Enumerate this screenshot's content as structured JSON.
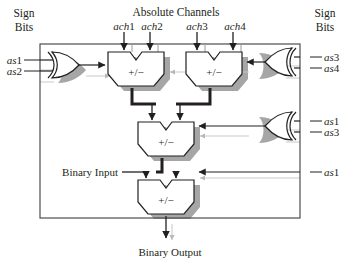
{
  "figure": {
    "title_top": "Absolute Channels",
    "sign_bits_left_line1": "Sign",
    "sign_bits_left_line2": "Bits",
    "sign_bits_right_line1": "Sign",
    "sign_bits_right_line2": "Bits",
    "binary_input": "Binary Input",
    "binary_output": "Binary Output"
  },
  "channels": [
    {
      "id": "ach1",
      "label_italic": "ach",
      "label_num": "1",
      "x": 124
    },
    {
      "id": "ach2",
      "label_italic": "ach",
      "label_num": "2",
      "x": 150
    },
    {
      "id": "ach3",
      "label_italic": "ach",
      "label_num": "3",
      "x": 197
    },
    {
      "id": "ach4",
      "label_italic": "ach",
      "label_num": "4",
      "x": 233
    }
  ],
  "sign_inputs_left": [
    {
      "id": "as1",
      "label_italic": "as",
      "label_num": "1"
    },
    {
      "id": "as2",
      "label_italic": "as",
      "label_num": "2"
    }
  ],
  "sign_inputs_right_top": [
    {
      "id": "as3",
      "label_italic": "as",
      "label_num": "3"
    },
    {
      "id": "as4",
      "label_italic": "as",
      "label_num": "4"
    }
  ],
  "sign_inputs_right_mid": [
    {
      "id": "as1",
      "label_italic": "as",
      "label_num": "1"
    },
    {
      "id": "as3",
      "label_italic": "as",
      "label_num": "3"
    }
  ],
  "sign_inputs_right_low": [
    {
      "id": "as1",
      "label_italic": "as",
      "label_num": "1"
    }
  ],
  "adders": [
    {
      "id": "adder-top-left",
      "label": "+/−"
    },
    {
      "id": "adder-top-right",
      "label": "+/−"
    },
    {
      "id": "adder-middle",
      "label": "+/−"
    },
    {
      "id": "adder-bottom",
      "label": "+/−"
    }
  ],
  "gates": [
    {
      "id": "xor-left",
      "type": "xor"
    },
    {
      "id": "xor-right-top",
      "type": "xor"
    },
    {
      "id": "xor-right-middle",
      "type": "xor"
    }
  ],
  "colors": {
    "ink": "#231f20",
    "shadow": "#a6a6a6",
    "light_line": "#b8b8b8",
    "border": "#4d4d4d",
    "fill": "#ffffff"
  }
}
